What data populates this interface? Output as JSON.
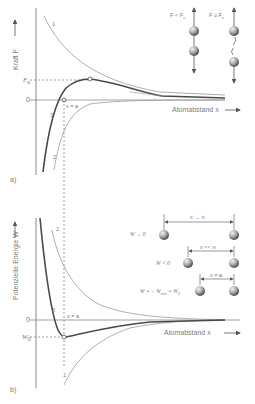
{
  "panel_a": {
    "caption": "a)",
    "ylabel": "Kraft  F",
    "xlabel": "Atomabstand  x",
    "tick_Fs": "F",
    "tick_Fs_sub": "s",
    "tick_zero": "0",
    "point_label": "x = a",
    "curve_labels": [
      "1",
      "2",
      "3"
    ],
    "inset": {
      "left_label": "F < F",
      "left_label_sub": "s",
      "right_label": "F ≥ F",
      "right_label_sub": "s"
    }
  },
  "panel_b": {
    "caption": "b)",
    "ylabel": "Potenzielle Energie  W",
    "xlabel": "Atomabstand  x",
    "tick_W0": "W",
    "tick_W0_sub": "0",
    "tick_zero": "0",
    "point_label": "x = a",
    "curve_labels": [
      "1",
      "2",
      "3"
    ],
    "inset": {
      "rows": [
        {
          "state": "W → 0",
          "distance": "x → ∞"
        },
        {
          "state": "W < 0",
          "distance": "x << ∞"
        },
        {
          "state": "W = − W",
          "state_sub": "min",
          "state_tail": " = W",
          "state_tail_sub": "0",
          "distance": "x = a"
        }
      ]
    }
  },
  "colors": {
    "axis": "#8a8a8a",
    "thin_curve": "#9a9a9a",
    "thick_curve": "#4a4a4a",
    "sphere_light": "#f0f0f0",
    "sphere_dark": "#5a5a5a",
    "text": "#7a7a7a"
  }
}
